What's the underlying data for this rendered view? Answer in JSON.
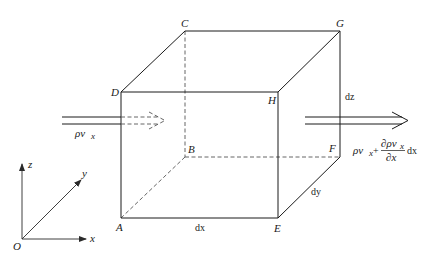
{
  "diagram": {
    "type": "control-volume-cube",
    "colors": {
      "line": "#1a1a1a",
      "hidden_line": "#555555",
      "background": "#ffffff"
    },
    "vertices": {
      "A": {
        "label": "A",
        "x": 121,
        "y": 218
      },
      "B": {
        "label": "B",
        "x": 185,
        "y": 157
      },
      "C": {
        "label": "C",
        "x": 185,
        "y": 31
      },
      "D": {
        "label": "D",
        "x": 121,
        "y": 92
      },
      "E": {
        "label": "E",
        "x": 278,
        "y": 218
      },
      "F": {
        "label": "F",
        "x": 340,
        "y": 157
      },
      "G": {
        "label": "G",
        "x": 340,
        "y": 31
      },
      "H": {
        "label": "H",
        "x": 278,
        "y": 92
      }
    },
    "dimensions": {
      "dx": "dx",
      "dy": "dy",
      "dz": "dz"
    },
    "flux_in": {
      "label_main": "ρv",
      "label_sub": "x"
    },
    "flux_out": {
      "label_main": "ρv",
      "label_sub": "x",
      "plus": "+",
      "numerator": "∂ρv",
      "numerator_sub": "x",
      "denominator": "∂x",
      "suffix": "dx"
    },
    "axes": {
      "origin": "O",
      "x": "x",
      "y": "y",
      "z": "z"
    }
  }
}
